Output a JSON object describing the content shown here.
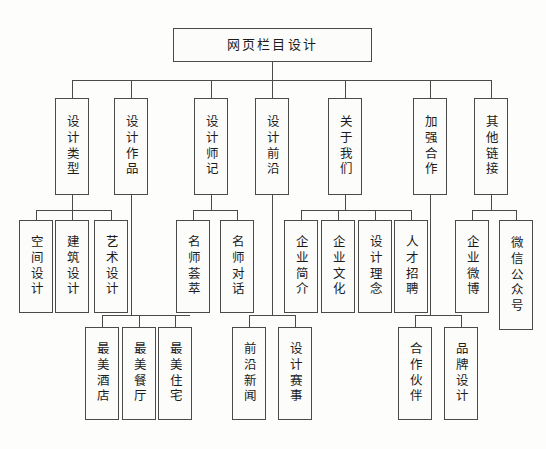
{
  "diagram": {
    "type": "hierarchy-tree",
    "title": "网页栏目设计",
    "orientation": "top-down",
    "levels": 4,
    "colors": {
      "line": "#4a4a4a",
      "border": "#4a4a4a",
      "text": "#1c1c1c",
      "background": "#fdfdfc",
      "node_fill": "#fcfcfb"
    },
    "root": {
      "label": "网页栏目设计"
    },
    "level2": [
      {
        "label": "设计类型"
      },
      {
        "label": "设计作品"
      },
      {
        "label": "设计师记"
      },
      {
        "label": "设计前沿"
      },
      {
        "label": "关于我们"
      },
      {
        "label": "加强合作"
      },
      {
        "label": "其他链接"
      }
    ],
    "level3": [
      {
        "label": "空间设计",
        "parent": "设计类型"
      },
      {
        "label": "建筑设计",
        "parent": "设计类型"
      },
      {
        "label": "艺术设计",
        "parent": "设计类型"
      },
      {
        "label": "名师荟萃",
        "parent": "设计师记"
      },
      {
        "label": "名师对话",
        "parent": "设计师记"
      },
      {
        "label": "企业简介",
        "parent": "关于我们"
      },
      {
        "label": "企业文化",
        "parent": "关于我们"
      },
      {
        "label": "设计理念",
        "parent": "关于我们"
      },
      {
        "label": "人才招聘",
        "parent": "关于我们"
      },
      {
        "label": "企业微博",
        "parent": "其他链接"
      },
      {
        "label": "微信公众号",
        "parent": "其他链接"
      }
    ],
    "level4": [
      {
        "label": "最美酒店",
        "parent": "设计作品"
      },
      {
        "label": "最美餐厅",
        "parent": "设计作品"
      },
      {
        "label": "最美住宅",
        "parent": "设计作品"
      },
      {
        "label": "前沿新闻",
        "parent": "设计前沿"
      },
      {
        "label": "设计赛事",
        "parent": "设计前沿"
      },
      {
        "label": "合作伙伴",
        "parent": "加强合作"
      },
      {
        "label": "品牌设计",
        "parent": "加强合作"
      }
    ]
  }
}
